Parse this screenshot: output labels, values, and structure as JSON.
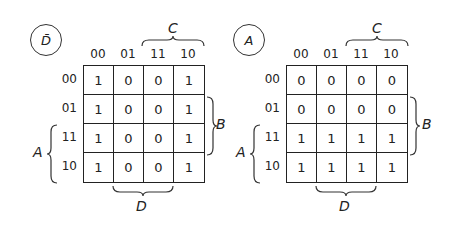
{
  "diagram": {
    "type": "karnaugh-map-pair",
    "maps": [
      {
        "function_label": "D̄",
        "column_variable_label": "C",
        "row_variable_label_right": "B",
        "row_variable_label_left": "A",
        "bottom_variable_label": "D",
        "column_headers": [
          "00",
          "01",
          "11",
          "10"
        ],
        "row_headers": [
          "00",
          "01",
          "11",
          "10"
        ],
        "cells": [
          [
            "1",
            "0",
            "0",
            "1"
          ],
          [
            "1",
            "0",
            "0",
            "1"
          ],
          [
            "1",
            "0",
            "0",
            "1"
          ],
          [
            "1",
            "0",
            "0",
            "1"
          ]
        ]
      },
      {
        "function_label": "A",
        "column_variable_label": "C",
        "row_variable_label_right": "B",
        "row_variable_label_left": "A",
        "bottom_variable_label": "D",
        "column_headers": [
          "00",
          "01",
          "11",
          "10"
        ],
        "row_headers": [
          "00",
          "01",
          "11",
          "10"
        ],
        "cells": [
          [
            "0",
            "0",
            "0",
            "0"
          ],
          [
            "0",
            "0",
            "0",
            "0"
          ],
          [
            "1",
            "1",
            "1",
            "1"
          ],
          [
            "1",
            "1",
            "1",
            "1"
          ]
        ]
      }
    ]
  }
}
